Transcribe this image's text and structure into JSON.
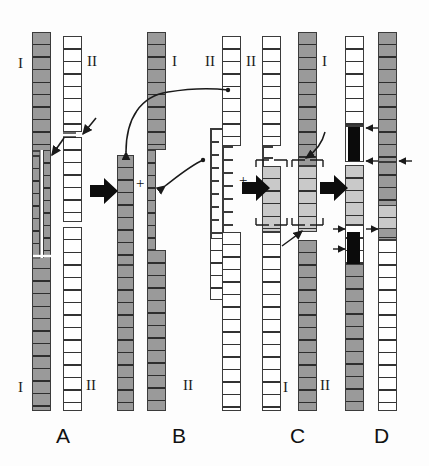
{
  "figure": {
    "type": "diagram",
    "title": "",
    "panel_labels": [
      "A",
      "B",
      "C",
      "D"
    ],
    "chromosome_labels": {
      "one": "I",
      "two": "II"
    },
    "operator_plus": "+",
    "colors": {
      "chromosome_I_fill": "#9a9a9a",
      "chromosome_II_fill": "#ffffff",
      "light_segment_fill": "#c9c9c9",
      "inserted_segment_fill": "#0b0b0b",
      "outline": "#3b3b3b",
      "background": "#ffffff"
    }
  },
  "panels": [
    {
      "id": "A",
      "label": "A",
      "caption_label": "A",
      "elements": [
        {
          "name": "chromosome-I",
          "label": "I",
          "fill": "gray",
          "top_label_pos": "top-left",
          "bottom_label_pos": "bottom-left",
          "feature": "vertical split / breakpoint gap in mid-arm"
        },
        {
          "name": "chromosome-II",
          "label": "II",
          "fill": "white",
          "top_label_pos": "top-right",
          "bottom_label_pos": "bottom-right",
          "feature": "breakpoint notches marked by thin arrows"
        }
      ],
      "annotations": [
        {
          "name": "breakpoint-arrow-chrII-upper",
          "type": "thin-arrow"
        },
        {
          "name": "breakpoint-arrow-chrI-mid",
          "type": "thin-arrow"
        }
      ]
    },
    {
      "id": "B",
      "label": "B",
      "caption_label": "B",
      "elements": [
        {
          "name": "fragment-I-distal",
          "label": "",
          "fill": "gray"
        },
        {
          "name": "chromosome-I-remainder",
          "label": "I",
          "fill": "gray"
        },
        {
          "name": "fragment-II-distal",
          "label": "",
          "fill": "white"
        },
        {
          "name": "chromosome-II-remainder",
          "label": "II",
          "fill": "white"
        }
      ],
      "annotations": [
        {
          "name": "exchange-arrow-I-to-II",
          "type": "curved-arrow"
        },
        {
          "name": "exchange-arrow-II-to-I",
          "type": "curved-arrow"
        }
      ],
      "operators": [
        "+",
        "+"
      ]
    },
    {
      "id": "C",
      "label": "C",
      "caption_label": "C",
      "elements": [
        {
          "name": "derivative-chromosome-II",
          "label": "II",
          "fill": "white",
          "feature": "translocated light-gray segment bracketed"
        },
        {
          "name": "derivative-chromosome-I",
          "label": "I",
          "fill": "gray",
          "feature": "translocated segment bracketed"
        }
      ],
      "annotations": [
        {
          "name": "junction-bracket-upper",
          "type": "bracket-pair"
        },
        {
          "name": "junction-bracket-lower",
          "type": "bracket-pair"
        },
        {
          "name": "junction-arrow-upper",
          "type": "thin-arrow"
        },
        {
          "name": "junction-arrow-lower",
          "type": "thin-arrow"
        }
      ]
    },
    {
      "id": "D",
      "label": "D",
      "caption_label": "D",
      "elements": [
        {
          "name": "recombinant-chromosome-II",
          "label": "",
          "fill": "white",
          "feature": "two black inserted blocks flagged by arrows"
        },
        {
          "name": "recombinant-chromosome-I",
          "label": "",
          "fill": "gray",
          "feature": "junction points flagged by arrows"
        }
      ],
      "annotations": [
        {
          "name": "insert-arrow-1",
          "type": "short-arrow"
        },
        {
          "name": "insert-arrow-2",
          "type": "short-arrow"
        },
        {
          "name": "insert-arrow-3",
          "type": "short-arrow"
        },
        {
          "name": "insert-arrow-4",
          "type": "short-arrow"
        },
        {
          "name": "insert-arrow-5",
          "type": "short-arrow"
        },
        {
          "name": "insert-arrow-6",
          "type": "short-arrow"
        }
      ]
    }
  ],
  "process_arrows": [
    {
      "name": "step-arrow-A-to-B",
      "direction": "right"
    },
    {
      "name": "step-arrow-B-to-C",
      "direction": "right"
    },
    {
      "name": "step-arrow-C-to-D",
      "direction": "right"
    }
  ]
}
